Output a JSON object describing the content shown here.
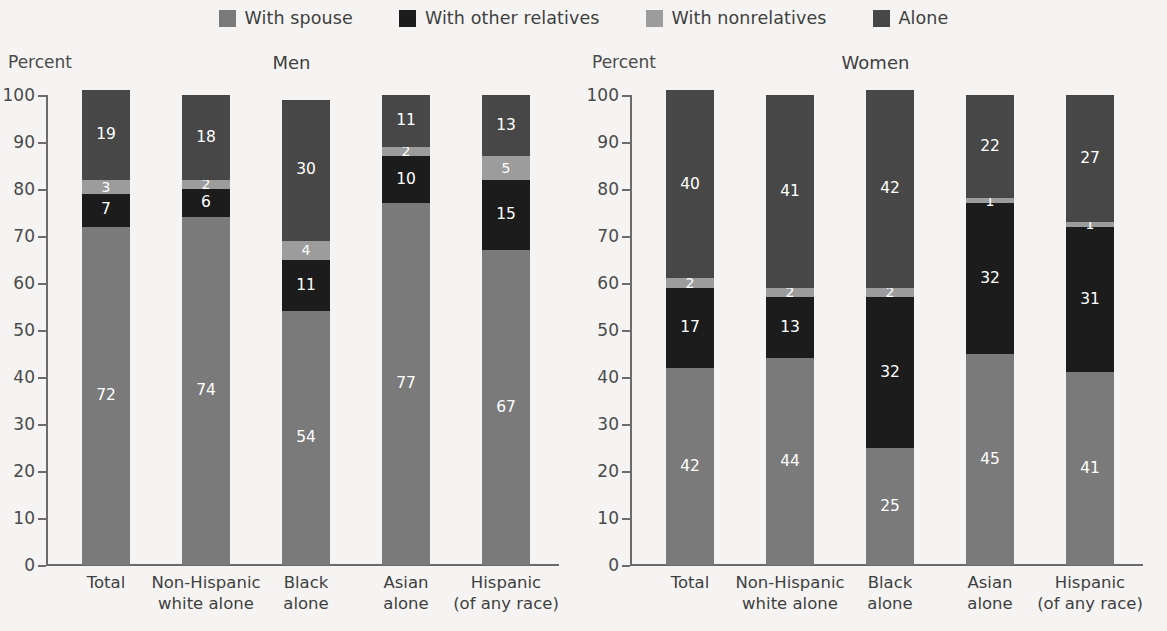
{
  "legend": {
    "items": [
      {
        "label": "With spouse",
        "key": "spouse",
        "color": "#7a7a7a",
        "swatch_icon": "legend-swatch-icon"
      },
      {
        "label": "With other relatives",
        "key": "other_relatives",
        "color": "#1c1c1c",
        "swatch_icon": "legend-swatch-icon"
      },
      {
        "label": "With nonrelatives",
        "key": "nonrelatives",
        "color": "#9c9c9c",
        "swatch_icon": "legend-swatch-icon"
      },
      {
        "label": "Alone",
        "key": "alone",
        "color": "#474747",
        "swatch_icon": "legend-swatch-icon"
      }
    ]
  },
  "chart_data": {
    "type": "bar",
    "subtype": "stacked-bar-100",
    "title": "",
    "panels": [
      {
        "title": "Men",
        "ylabel": "Percent",
        "categories": [
          "Total",
          "Non-Hispanic\nwhite alone",
          "Black\nalone",
          "Asian\nalone",
          "Hispanic\n(of any race)"
        ],
        "series": [
          {
            "name": "With spouse",
            "color": "#7a7a7a",
            "values": [
              72,
              74,
              54,
              77,
              67
            ]
          },
          {
            "name": "With other relatives",
            "color": "#1c1c1c",
            "values": [
              7,
              6,
              11,
              10,
              15
            ]
          },
          {
            "name": "With nonrelatives",
            "color": "#9c9c9c",
            "values": [
              3,
              2,
              4,
              2,
              5
            ]
          },
          {
            "name": "Alone",
            "color": "#474747",
            "values": [
              19,
              18,
              30,
              11,
              13
            ]
          }
        ]
      },
      {
        "title": "Women",
        "ylabel": "Percent",
        "categories": [
          "Total",
          "Non-Hispanic\nwhite alone",
          "Black\nalone",
          "Asian\nalone",
          "Hispanic\n(of any race)"
        ],
        "series": [
          {
            "name": "With spouse",
            "color": "#7a7a7a",
            "values": [
              42,
              44,
              25,
              45,
              41
            ]
          },
          {
            "name": "With other relatives",
            "color": "#1c1c1c",
            "values": [
              17,
              13,
              32,
              32,
              31
            ]
          },
          {
            "name": "With nonrelatives",
            "color": "#9c9c9c",
            "values": [
              2,
              2,
              2,
              1,
              1
            ]
          },
          {
            "name": "Alone",
            "color": "#474747",
            "values": [
              40,
              41,
              42,
              22,
              27
            ]
          }
        ]
      }
    ],
    "ylim": [
      0,
      100
    ],
    "yticks": [
      0,
      10,
      20,
      30,
      40,
      50,
      60,
      70,
      80,
      90,
      100
    ],
    "ytick_labels": [
      "0",
      "10",
      "20",
      "30",
      "40",
      "50",
      "60",
      "70",
      "80",
      "90",
      "100"
    ],
    "xlabel": "",
    "grid": false,
    "legend_position": "top-center"
  }
}
